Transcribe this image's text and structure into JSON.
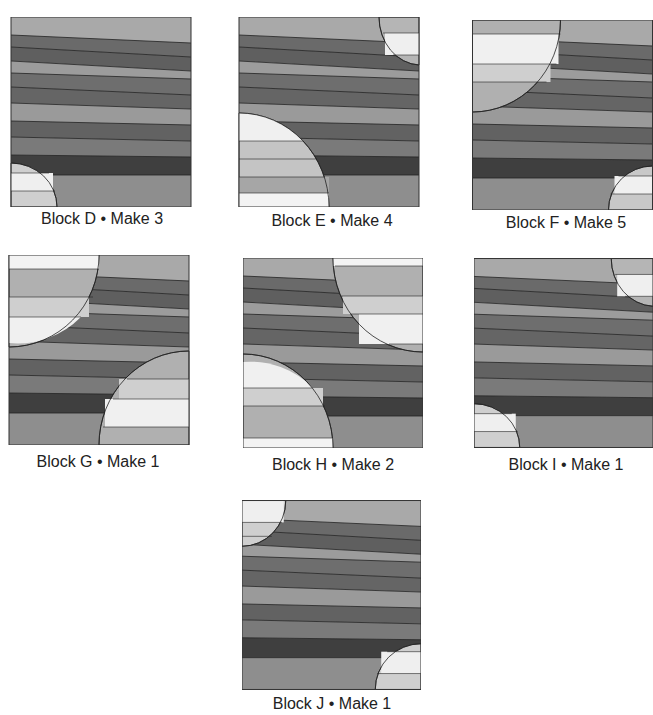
{
  "colors": {
    "light": "#a9a9a9",
    "mid": "#7c7c7c",
    "dark": "#5f5f5f",
    "darkest": "#3f3f3f",
    "white": "#efefef",
    "pale": "#cfcfcf",
    "outline": "#222222"
  },
  "blocks": [
    {
      "id": "D",
      "label": "Block D • Make 3"
    },
    {
      "id": "E",
      "label": "Block E • Make 4"
    },
    {
      "id": "F",
      "label": "Block F • Make 5"
    },
    {
      "id": "G",
      "label": "Block G • Make 1"
    },
    {
      "id": "H",
      "label": "Block H • Make 2"
    },
    {
      "id": "I",
      "label": "Block I • Make 1"
    },
    {
      "id": "J",
      "label": "Block J • Make 1"
    }
  ]
}
